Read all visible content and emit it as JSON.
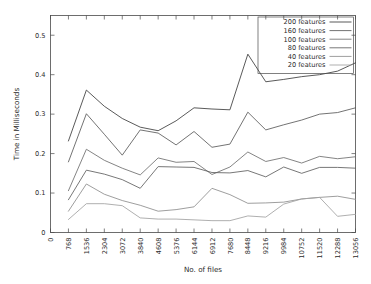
{
  "chart_data": {
    "type": "line",
    "title": "",
    "xlabel": "No. of files",
    "ylabel": "Time in Milliseconds",
    "xlim": [
      0,
      13056
    ],
    "ylim": [
      0,
      0.55
    ],
    "ytick_labels": [
      "0",
      "0.1",
      "0.2",
      "0.3",
      "0.4",
      "0.5"
    ],
    "ytick_values": [
      0,
      0.1,
      0.2,
      0.3,
      0.4,
      0.5
    ],
    "xtick_labels": [
      "0",
      "768",
      "1536",
      "2304",
      "3072",
      "3840",
      "4608",
      "5376",
      "6144",
      "6912",
      "7680",
      "8448",
      "9216",
      "9984",
      "10752",
      "11520",
      "12288",
      "13056"
    ],
    "xtick_values": [
      0,
      768,
      1536,
      2304,
      3072,
      3840,
      4608,
      5376,
      6144,
      6912,
      7680,
      8448,
      9216,
      9984,
      10752,
      11520,
      12288,
      13056
    ],
    "grid": false,
    "legend_position": "top-right",
    "x": [
      768,
      1536,
      2304,
      3072,
      3840,
      4608,
      5376,
      6144,
      6912,
      7680,
      8448,
      9216,
      9984,
      10752,
      11520,
      12288,
      13056
    ],
    "series": [
      {
        "name": "200 features",
        "color": "#3c3c3c",
        "values": [
          0.232,
          0.361,
          0.32,
          0.289,
          0.267,
          0.258,
          0.283,
          0.316,
          0.313,
          0.311,
          0.452,
          0.382,
          0.388,
          0.395,
          0.4,
          0.409,
          0.43
        ]
      },
      {
        "name": "160 features",
        "color": "#5a5a5a",
        "values": [
          0.179,
          0.301,
          0.249,
          0.196,
          0.26,
          0.252,
          0.222,
          0.256,
          0.216,
          0.224,
          0.305,
          0.26,
          0.273,
          0.285,
          0.3,
          0.304,
          0.316
        ]
      },
      {
        "name": "100 features",
        "color": "#6e6e6e",
        "values": [
          0.106,
          0.211,
          0.183,
          0.163,
          0.146,
          0.189,
          0.178,
          0.18,
          0.147,
          0.166,
          0.204,
          0.18,
          0.19,
          0.176,
          0.193,
          0.187,
          0.192
        ]
      },
      {
        "name": "80 features",
        "color": "#5f5f5f",
        "values": [
          0.083,
          0.158,
          0.148,
          0.134,
          0.112,
          0.167,
          0.166,
          0.165,
          0.152,
          0.151,
          0.157,
          0.141,
          0.166,
          0.15,
          0.165,
          0.165,
          0.163
        ]
      },
      {
        "name": "40 features",
        "color": "#8c8c8c",
        "values": [
          0.054,
          0.123,
          0.097,
          0.081,
          0.069,
          0.054,
          0.058,
          0.065,
          0.112,
          0.096,
          0.074,
          0.075,
          0.077,
          0.085,
          0.089,
          0.092,
          0.084
        ]
      },
      {
        "name": "20 features",
        "color": "#a0a0a0",
        "values": [
          0.033,
          0.073,
          0.073,
          0.068,
          0.037,
          0.034,
          0.034,
          0.032,
          0.03,
          0.03,
          0.042,
          0.039,
          0.072,
          0.085,
          0.089,
          0.041,
          0.046
        ]
      }
    ]
  }
}
